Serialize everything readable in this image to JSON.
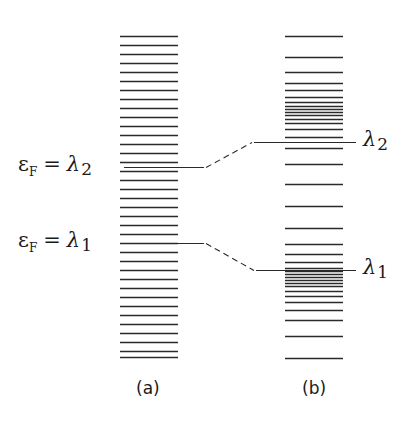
{
  "diagram": {
    "panels": [
      {
        "id": "a",
        "label": "(a)",
        "x_range": [
          120,
          178
        ],
        "levels_y": [
          36,
          45,
          54,
          63,
          72,
          81,
          90,
          99,
          108,
          117,
          126,
          135,
          144,
          153,
          162,
          171,
          180,
          189,
          198,
          207,
          216,
          225,
          234,
          243,
          252,
          261,
          270,
          279,
          288,
          297,
          306,
          315,
          324,
          333,
          342,
          351,
          357
        ],
        "annotations": [
          {
            "text_parts": [
              "ε",
              "F",
              "=",
              "λ",
              "2"
            ],
            "y": 167
          },
          {
            "text_parts": [
              "ε",
              "F",
              "=",
              "λ",
              "1"
            ],
            "y": 243
          }
        ]
      },
      {
        "id": "b",
        "label": "(b)",
        "x_range": [
          285,
          343
        ],
        "levels_y": [
          36,
          57,
          72,
          83,
          90,
          97,
          102,
          106,
          109,
          112,
          115,
          119,
          123,
          129,
          137,
          148,
          164,
          184,
          206,
          228,
          244,
          254,
          262,
          268,
          271,
          274,
          277,
          280,
          283,
          286,
          291,
          296,
          302,
          310,
          320,
          336,
          358
        ],
        "annotations": [
          {
            "text_parts": [
              "λ",
              "2"
            ],
            "y": 142
          },
          {
            "text_parts": [
              "λ",
              "1"
            ],
            "y": 270
          }
        ]
      }
    ],
    "connectors": [
      {
        "from": "εF = λ2",
        "to": "λ2",
        "solid_left": [
          124,
          167,
          204,
          167
        ],
        "dashed": [
          206,
          167,
          252,
          142
        ],
        "solid_right": [
          254,
          142,
          356,
          142
        ]
      },
      {
        "from": "εF = λ1",
        "to": "λ1",
        "solid_left": [
          124,
          243,
          204,
          243
        ],
        "dashed": [
          206,
          243,
          254,
          270
        ],
        "solid_right": [
          256,
          270,
          356,
          270
        ]
      }
    ],
    "labels": {
      "eps": "ε",
      "F": "F",
      "eq": "=",
      "lambda": "λ",
      "one": "1",
      "two": "2",
      "panel_a": "(a)",
      "panel_b": "(b)"
    },
    "colors": {
      "line": "#2a2a2a",
      "background": "#ffffff"
    }
  }
}
